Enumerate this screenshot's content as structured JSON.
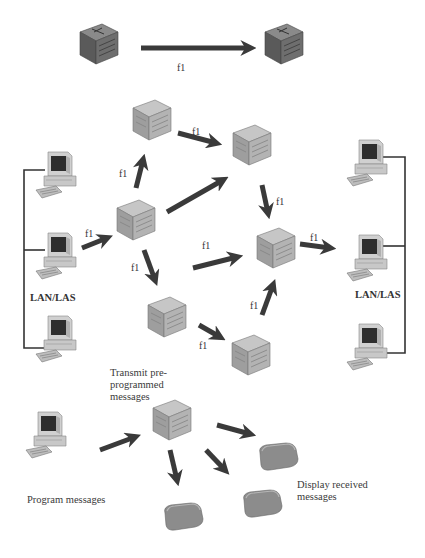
{
  "diagram": {
    "type": "network-diagram",
    "link_label": "f1",
    "mux_label": "CNR MUX",
    "radio_label": "CNR",
    "f3_label": "F3",
    "lan_left_label": "LAN/LAS",
    "lan_right_label": "LAN/LAS",
    "transmit_note": [
      "Transmit pre-",
      "programmed",
      "messages"
    ],
    "program_note": "Program messages",
    "display_note": [
      "Display received",
      "messages"
    ],
    "colors": {
      "arrow": "#3a3a3a",
      "node_face": "#a8a8a8",
      "node_side": "#8a8a8a",
      "node_top": "#c4c4c4",
      "radio": "#8c8c8c",
      "line": "#333333"
    }
  },
  "labels": {
    "top_f1": "f1",
    "f1_a": "f1",
    "f1_b": "f1",
    "f1_c": "f1",
    "f1_d": "f1",
    "f1_e": "f1",
    "f1_f": "f1",
    "f1_g": "f1",
    "f1_h": "f1",
    "f1_i": "f1",
    "f1_j": "f1"
  }
}
